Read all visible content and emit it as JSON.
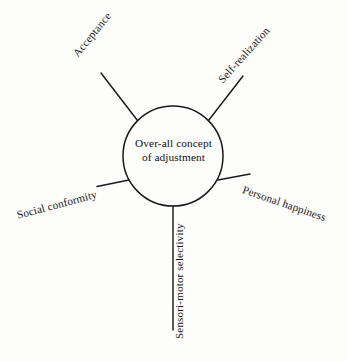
{
  "diagram": {
    "title": "Over-all concept of adjustment",
    "type": "radial-spoke-diagram",
    "hub": {
      "name": "over-all-concept-of-adjustment",
      "line1": "Over-all concept",
      "line2": "of adjustment",
      "shape": "circle",
      "stroke_color": "#1a1a1e",
      "fill_color": "none"
    },
    "nodes": [
      {
        "id": "acceptance",
        "label": "Acceptance",
        "direction": "upper-left",
        "angle_deg": -51
      },
      {
        "id": "self-realization",
        "label": "Self-realization",
        "direction": "upper-right",
        "angle_deg": -48
      },
      {
        "id": "personal-happiness",
        "label": "Personal happiness",
        "direction": "right",
        "angle_deg": 19
      },
      {
        "id": "social-conformity",
        "label": "Social conformity",
        "direction": "left",
        "angle_deg": -15
      },
      {
        "id": "sensori-motor-selectivity",
        "label": "Sensori-motor selectivity",
        "direction": "bottom",
        "angle_deg": -90
      }
    ],
    "colors": {
      "background": "#fdfdfc",
      "ink": "#17161a",
      "line": "#1a1a1e"
    }
  }
}
